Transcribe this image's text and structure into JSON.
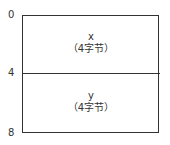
{
  "axis": {
    "ticks": [
      "0",
      "4",
      "8"
    ]
  },
  "fields": [
    {
      "name": "x",
      "size": "（4字节）"
    },
    {
      "name": "y",
      "size": "（4字节）"
    }
  ]
}
